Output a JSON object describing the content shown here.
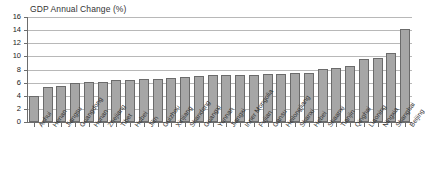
{
  "chart_data": {
    "type": "bar",
    "title": "GDP Annual Change (%)",
    "xlabel": "",
    "ylabel": "",
    "ylim": [
      0,
      16
    ],
    "yticks": [
      0,
      2,
      4,
      6,
      8,
      10,
      12,
      14,
      16
    ],
    "grid": true,
    "legend": false,
    "bar_color": "#a6a6a6",
    "bar_border_color": "#6b6b6b",
    "categories": [
      "Anhui",
      "Henan",
      "Jiangsu",
      "Guangdong",
      "Hunan",
      "Zhejiang",
      "Tibet",
      "Hubei",
      "Jilin",
      "Guizhou",
      "Xinjiang",
      "Shandong",
      "Guangxi",
      "Yunnan",
      "Jiangxi",
      "Inner Mongolia",
      "Fujian",
      "Gansu",
      "Heilongjiang",
      "Shanxi",
      "Hebei",
      "Shaanxi",
      "Tianjin",
      "Qinghai",
      "Liaoning",
      "Ningxia",
      "Shanghai",
      "Beijing"
    ],
    "values": [
      3.9,
      5.4,
      5.5,
      6.0,
      6.1,
      6.1,
      6.4,
      6.4,
      6.5,
      6.6,
      6.7,
      6.8,
      7.0,
      7.1,
      7.1,
      7.1,
      7.2,
      7.3,
      7.3,
      7.4,
      7.4,
      8.1,
      8.3,
      8.6,
      9.6,
      9.7,
      10.5,
      11.3
    ]
  },
  "extra": {
    "last_bar_value": 14.1,
    "last_bar_category": "Beijing"
  }
}
